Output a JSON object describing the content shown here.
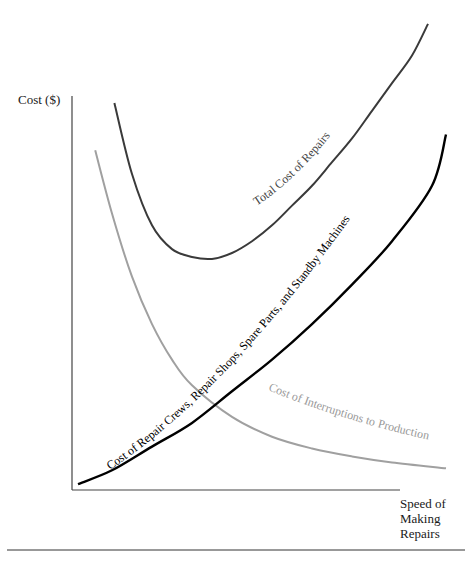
{
  "chart_data": {
    "type": "line",
    "title": "",
    "xlabel": "Speed of Making Repairs",
    "ylabel": "Cost ($)",
    "xlim": [
      0,
      100
    ],
    "ylim": [
      0,
      100
    ],
    "grid": false,
    "ticks": "none",
    "legend": "inline curve labels",
    "series": [
      {
        "name": "Total Cost of Repairs",
        "color": "#3a3a3a",
        "x": [
          10.6,
          15,
          20,
          25,
          30,
          35,
          40,
          45,
          50,
          55,
          60,
          65,
          70,
          75,
          80,
          85,
          89
        ],
        "y": [
          98,
          80,
          67,
          61,
          59,
          58.5,
          60,
          63,
          67,
          72,
          77,
          83,
          89,
          96,
          103,
          110,
          118
        ]
      },
      {
        "name": "Cost of Repair Crews, Repair Shops, Spare Parts, and Standby Machines",
        "color": "#000000",
        "x": [
          1.5,
          10,
          20,
          30,
          40,
          50,
          60,
          70,
          80,
          90,
          93.5
        ],
        "y": [
          1.5,
          5,
          11,
          17,
          25,
          33,
          42,
          52,
          63,
          77,
          90
        ]
      },
      {
        "name": "Cost of Interruptions to Production",
        "color": "#a0a0a0",
        "x": [
          5.8,
          10,
          15,
          20,
          25,
          30,
          40,
          50,
          60,
          70,
          80,
          93.5
        ],
        "y": [
          86,
          70,
          54,
          42,
          33,
          26.5,
          18.5,
          13.5,
          10.5,
          8.5,
          7,
          5.5
        ]
      }
    ]
  },
  "labels": {
    "y_axis": "Cost ($)",
    "x_axis_line1": "Speed of",
    "x_axis_line2": "Making",
    "x_axis_line3": "Repairs",
    "total_curve": "Total Cost of Repairs",
    "repair_curve": "Cost of Repair Crews, Repair Shops, Spare Parts, and Standby Machines",
    "interrupt_curve": "Cost of Interruptions to Production"
  }
}
